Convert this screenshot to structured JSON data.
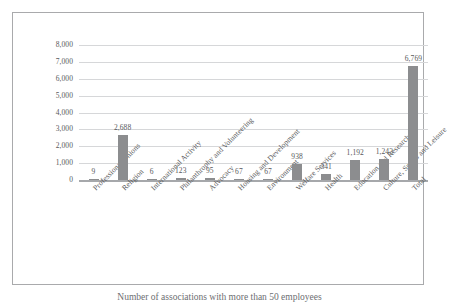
{
  "chart_data": {
    "type": "bar",
    "title": "",
    "xlabel": "",
    "ylabel": "",
    "ylim": [
      0,
      8000
    ],
    "ytick_labels": [
      "8,000",
      "7,000",
      "6,000",
      "5,000",
      "4,000",
      "3,000",
      "2,000",
      "1,000",
      "0"
    ],
    "ytick_values": [
      8000,
      7000,
      6000,
      5000,
      4000,
      3000,
      2000,
      1000,
      0
    ],
    "grid": true,
    "legend": "none",
    "bar_color": "#8c8d8f",
    "categories": [
      "Professional Unions",
      "Religion",
      "International Activity",
      "Philanthrophy and Volunteering",
      "Advocacy",
      "Housing and Development",
      "Environment",
      "Welfare Services",
      "Health",
      "Education and Research",
      "Culture, Sports and Leisure",
      "Total"
    ],
    "values": [
      9,
      2688,
      6,
      123,
      95,
      67,
      67,
      938,
      341,
      1192,
      1243,
      6769
    ],
    "value_labels": [
      "9",
      "2,688",
      "6",
      "123",
      "95",
      "67",
      "67",
      "938",
      "341",
      "1,192",
      "1,243",
      "6,769"
    ]
  },
  "caption": {
    "text": "Number of associations with more than 50 employees"
  }
}
